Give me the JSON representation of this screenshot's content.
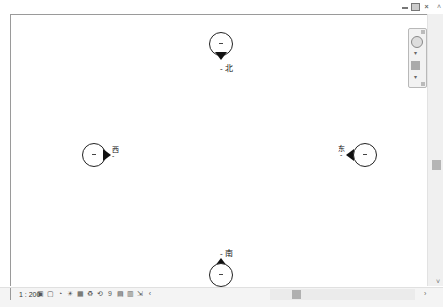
{
  "window": {
    "controls": [
      "minimize",
      "restore",
      "close"
    ],
    "close_glyph": "×"
  },
  "markers": [
    {
      "id": "north",
      "label": "北",
      "dash": "-"
    },
    {
      "id": "west",
      "label": "西",
      "dash": "-"
    },
    {
      "id": "east",
      "label": "东",
      "dash": "-"
    },
    {
      "id": "south",
      "label": "南",
      "dash": "-"
    }
  ],
  "navigation_bar": {
    "items": [
      "steering-wheel",
      "zoom"
    ],
    "dropdown_glyph": "▾"
  },
  "statusbar": {
    "scale": "1 : 200",
    "tool_glyphs": [
      "▣",
      "▢",
      "◔",
      "☀",
      "▦",
      "♻",
      "⟲",
      "9",
      "▤",
      "▥",
      "⇲",
      "‹"
    ],
    "scroll_right_glyph": "›"
  },
  "scrollbars": {
    "up_glyph": "˄",
    "down_glyph": "˅"
  },
  "colors": {
    "marker": "#222222",
    "frame": "#9a9a9a",
    "thumb": "#b5b5b5"
  }
}
